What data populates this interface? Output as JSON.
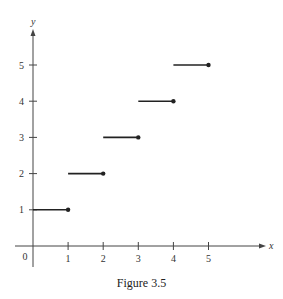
{
  "chart_data": {
    "type": "line",
    "subtype": "step-function",
    "title": "",
    "caption": "Figure 3.5",
    "xlabel": "x",
    "ylabel": "y",
    "xlim": [
      0,
      6.5
    ],
    "ylim": [
      0,
      6
    ],
    "x_ticks": [
      1,
      2,
      3,
      4,
      5
    ],
    "y_ticks": [
      1,
      2,
      3,
      4,
      5
    ],
    "origin_label": "0",
    "grid": false,
    "legend": null,
    "segments": [
      {
        "x_start": 0,
        "x_end": 1,
        "y": 1,
        "closed_end": "right"
      },
      {
        "x_start": 1,
        "x_end": 2,
        "y": 2,
        "closed_end": "right"
      },
      {
        "x_start": 2,
        "x_end": 3,
        "y": 3,
        "closed_end": "right"
      },
      {
        "x_start": 3,
        "x_end": 4,
        "y": 4,
        "closed_end": "right"
      },
      {
        "x_start": 4,
        "x_end": 5,
        "y": 5,
        "closed_end": "right"
      }
    ],
    "colors": {
      "line": "#222222",
      "axis": "#444444"
    }
  }
}
